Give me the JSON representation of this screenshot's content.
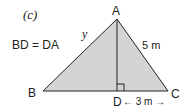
{
  "figure": {
    "part_label": "(c)",
    "condition": "BD = DA",
    "vertices": {
      "A": "A",
      "B": "B",
      "C": "C",
      "D": "D"
    },
    "side_labels": {
      "AB": "y",
      "AC": "5 m",
      "DC": "← 3 m →"
    },
    "right_angle_at": "D",
    "colors": {
      "fill": "#d4d4d4",
      "stroke": "#222222"
    }
  }
}
